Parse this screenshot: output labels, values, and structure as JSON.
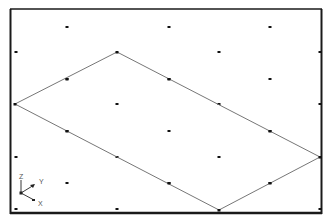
{
  "viewport": {
    "background": "#ffffff",
    "frame_color": "#1a1a1a",
    "grid_dot_color": "#111111",
    "edge_color": "#666666"
  },
  "grid_dots": [
    [
      67,
      27
    ],
    [
      169,
      27
    ],
    [
      270,
      27
    ],
    [
      16,
      52
    ],
    [
      219,
      52
    ],
    [
      320,
      52
    ],
    [
      67,
      79
    ],
    [
      169,
      79
    ],
    [
      270,
      79
    ],
    [
      117,
      104
    ],
    [
      219,
      104
    ],
    [
      320,
      104
    ],
    [
      67,
      131
    ],
    [
      169,
      131
    ],
    [
      270,
      131
    ],
    [
      16,
      157
    ],
    [
      117,
      157
    ],
    [
      219,
      157
    ],
    [
      67,
      183
    ],
    [
      169,
      183
    ],
    [
      270,
      183
    ],
    [
      16,
      209
    ],
    [
      117,
      209
    ],
    [
      320,
      209
    ]
  ],
  "shape": {
    "type": "parallelogram",
    "vertices": [
      [
        117,
        52
      ],
      [
        320,
        157
      ],
      [
        219,
        210
      ],
      [
        15,
        104
      ]
    ],
    "edge_midpoints": [
      [
        67,
        79
      ],
      [
        169,
        79
      ],
      [
        270,
        131
      ],
      [
        270,
        183
      ],
      [
        169,
        183
      ],
      [
        67,
        131
      ]
    ]
  },
  "axis_triad": {
    "z_label": "Z",
    "y_label": "Y",
    "x_label": "X"
  }
}
